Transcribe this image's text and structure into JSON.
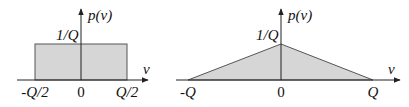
{
  "colors": {
    "fill": "#d6d6d6",
    "stroke": "#555555",
    "axis": "#222222"
  },
  "left_plot": {
    "y_axis_label": "p(v)",
    "x_axis_label": "v",
    "height_label": "1/Q",
    "ticks": [
      "-Q/2",
      "0",
      "Q/2"
    ]
  },
  "right_plot": {
    "y_axis_label": "p(v)",
    "x_axis_label": "v",
    "height_label": "1/Q",
    "ticks": [
      "-Q",
      "0",
      "Q"
    ]
  }
}
